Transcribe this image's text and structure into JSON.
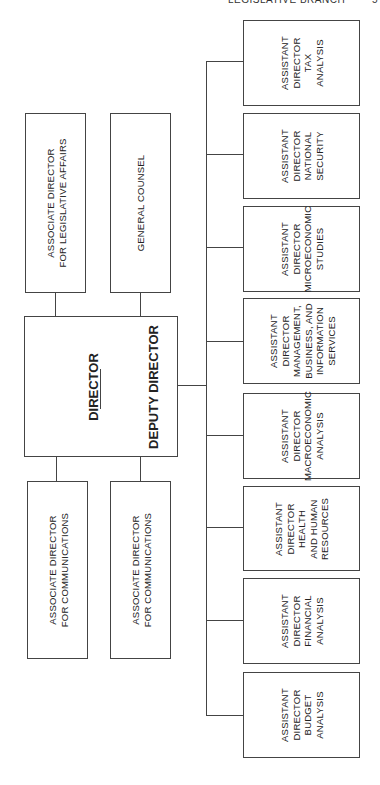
{
  "header": {
    "running_title": "LEGISLATIVE BRANCH",
    "page_number": "5"
  },
  "director_box": {
    "director": "DIRECTOR",
    "deputy": "DEPUTY DIRECTOR"
  },
  "top_boxes": [
    {
      "lines": [
        "ASSOCIATE DIRECTOR",
        "FOR LEGISLATIVE AFFAIRS"
      ]
    },
    {
      "lines": [
        "GENERAL COUNSEL"
      ]
    }
  ],
  "bottom_boxes": [
    {
      "lines": [
        "ASSOCIATE DIRECTOR",
        "FOR COMMUNICATIONS"
      ]
    },
    {
      "lines": [
        "ASSOCIATE DIRECTOR",
        "FOR COMMUNICATIONS"
      ]
    }
  ],
  "assistant_directors": [
    {
      "lines": [
        "ASSISTANT",
        "DIRECTOR",
        "TAX",
        "ANALYSIS"
      ]
    },
    {
      "lines": [
        "ASSISTANT",
        "DIRECTOR",
        "NATIONAL",
        "SECURITY"
      ]
    },
    {
      "lines": [
        "ASSISTANT",
        "DIRECTOR",
        "MICROECONOMIC",
        "STUDIES"
      ]
    },
    {
      "lines": [
        "ASSISTANT",
        "DIRECTOR",
        "MANAGEMENT,",
        "BUSINESS, AND",
        "INFORMATION",
        "SERVICES"
      ]
    },
    {
      "lines": [
        "ASSISTANT",
        "DIRECTOR",
        "MACROECONOMIC",
        "ANALYSIS"
      ]
    },
    {
      "lines": [
        "ASSISTANT",
        "DIRECTOR",
        "HEALTH",
        "AND HUMAN",
        "RESOURCES"
      ]
    },
    {
      "lines": [
        "ASSISTANT",
        "DIRECTOR",
        "FINANCIAL",
        "ANALYSIS"
      ]
    },
    {
      "lines": [
        "ASSISTANT",
        "DIRECTOR",
        "BUDGET",
        "ANALYSIS"
      ]
    }
  ]
}
